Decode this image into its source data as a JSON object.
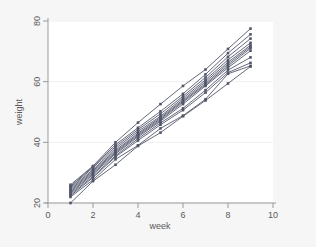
{
  "chart_data": {
    "type": "line",
    "title": "",
    "subtitle": "",
    "xlabel": "week",
    "ylabel": "weight",
    "xlim": [
      0,
      10
    ],
    "ylim": [
      20,
      80
    ],
    "x_ticks": [
      0,
      2,
      4,
      6,
      8,
      10
    ],
    "y_ticks": [
      20,
      40,
      60,
      80
    ],
    "x_tick_labels": [
      "0",
      "2",
      "4",
      "6",
      "8",
      "10"
    ],
    "y_tick_labels": [
      "20",
      "40",
      "60",
      "80"
    ],
    "grid": "horizontal-faint",
    "legend": "none",
    "legend_position": "none",
    "marker": "filled-square",
    "line_color": "#53576b",
    "marker_color": "#53576b",
    "plot_background": "#ffffff",
    "figure_background": "#f6f6f6",
    "axis_color": "#9a9a9a",
    "gridline_color": "#f0f0f2",
    "x": [
      1,
      2,
      3,
      4,
      5,
      6,
      7,
      8,
      9
    ],
    "series": [
      {
        "name": "subject-1",
        "values": [
          26.0,
          32.2,
          40.0,
          46.5,
          52.6,
          58.6,
          64.0,
          70.8,
          77.5
        ]
      },
      {
        "name": "subject-2",
        "values": [
          25.5,
          32.0,
          39.2,
          44.8,
          50.2,
          56.0,
          62.4,
          69.4,
          75.6
        ]
      },
      {
        "name": "subject-3",
        "values": [
          25.2,
          31.6,
          38.6,
          44.2,
          49.4,
          55.2,
          61.4,
          68.2,
          74.2
        ]
      },
      {
        "name": "subject-4",
        "values": [
          24.8,
          31.0,
          38.0,
          43.6,
          48.6,
          54.6,
          60.6,
          67.2,
          72.8
        ]
      },
      {
        "name": "subject-5",
        "values": [
          24.4,
          30.6,
          37.4,
          43.0,
          48.2,
          54.0,
          60.0,
          66.4,
          72.0
        ]
      },
      {
        "name": "subject-6",
        "values": [
          24.0,
          30.2,
          37.0,
          42.6,
          47.8,
          53.6,
          59.4,
          65.8,
          71.5
        ]
      },
      {
        "name": "subject-7",
        "values": [
          23.6,
          29.8,
          36.6,
          42.2,
          47.4,
          53.2,
          59.0,
          65.2,
          71.0
        ]
      },
      {
        "name": "subject-8",
        "values": [
          23.2,
          29.4,
          36.2,
          41.8,
          47.0,
          52.6,
          58.6,
          64.6,
          70.2
        ]
      },
      {
        "name": "subject-9",
        "values": [
          22.8,
          28.8,
          35.6,
          41.2,
          46.4,
          51.2,
          57.2,
          63.8,
          68.0
        ]
      },
      {
        "name": "subject-10",
        "values": [
          22.4,
          28.4,
          35.2,
          40.6,
          45.8,
          50.6,
          56.4,
          63.0,
          66.2
        ]
      },
      {
        "name": "subject-11",
        "values": [
          22.0,
          27.6,
          34.4,
          39.0,
          44.6,
          48.8,
          54.2,
          62.6,
          65.2
        ]
      },
      {
        "name": "subject-12",
        "values": [
          20.0,
          27.2,
          32.6,
          38.8,
          43.2,
          48.6,
          53.8,
          59.4,
          65.0
        ]
      }
    ]
  }
}
